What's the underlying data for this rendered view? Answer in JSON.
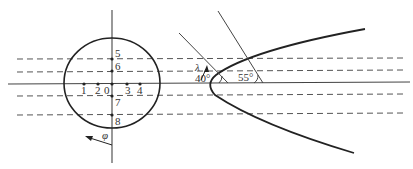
{
  "diagram": {
    "type": "geometry-figure",
    "left_view": {
      "description": "circle cross-section with measurement points",
      "point_labels": [
        "1",
        "2",
        "0",
        "3",
        "4",
        "5",
        "6",
        "7",
        "8"
      ],
      "angle_symbol": "φ"
    },
    "right_view": {
      "description": "parabolic profile with inclined lines",
      "angle_labels": [
        "40°",
        "55°"
      ],
      "wavelength_symbol": "λ"
    },
    "line_styles": {
      "solid_axis_color": "#444444",
      "dashed_color": "#555555",
      "curve_color": "#222222"
    }
  }
}
